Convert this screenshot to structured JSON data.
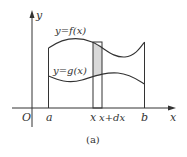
{
  "figure": {
    "caption": "(a)",
    "axes": {
      "x_label": "x",
      "y_label": "y",
      "origin_label": "O"
    },
    "curves": [
      {
        "name": "upper",
        "label": "y=f(x)"
      },
      {
        "name": "lower",
        "label": "y=g(x)"
      }
    ],
    "x_ticks": [
      {
        "label": "a"
      },
      {
        "label": "x"
      },
      {
        "label": "x+dx"
      },
      {
        "label": "b"
      }
    ],
    "strip": {
      "description": "shaded vertical strip between x and x+dx",
      "fill": "#d9d9d9"
    },
    "colors": {
      "stroke": "#333333",
      "shade": "#d9d9d9",
      "background": "#ffffff"
    }
  }
}
